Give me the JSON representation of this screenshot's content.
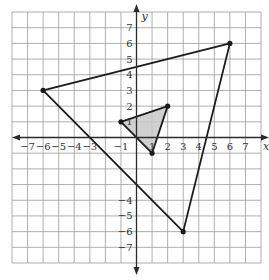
{
  "chart_data": {
    "type": "coordinate-plane",
    "title": "",
    "xlabel": "x",
    "ylabel": "y",
    "xlim": [
      -8,
      8
    ],
    "ylim": [
      -8,
      8
    ],
    "grid": true,
    "x_tick_labels": [
      {
        "value": -7,
        "label": "−7"
      },
      {
        "value": -6,
        "label": "−6"
      },
      {
        "value": -5,
        "label": "−5"
      },
      {
        "value": -4,
        "label": "−4"
      },
      {
        "value": -3,
        "label": "−3"
      },
      {
        "value": -1,
        "label": "−1"
      },
      {
        "value": 1,
        "label": "1"
      },
      {
        "value": 2,
        "label": "2"
      },
      {
        "value": 3,
        "label": "3"
      },
      {
        "value": 4,
        "label": "4"
      },
      {
        "value": 5,
        "label": "5"
      },
      {
        "value": 6,
        "label": "6"
      },
      {
        "value": 7,
        "label": "7"
      }
    ],
    "y_tick_labels": [
      {
        "value": 7,
        "label": "7"
      },
      {
        "value": 6,
        "label": "6"
      },
      {
        "value": 5,
        "label": "5"
      },
      {
        "value": 4,
        "label": "4"
      },
      {
        "value": 3,
        "label": "3"
      },
      {
        "value": 2,
        "label": "2"
      },
      {
        "value": 1,
        "label": "1"
      },
      {
        "value": -4,
        "label": "−4"
      },
      {
        "value": -5,
        "label": "−5"
      },
      {
        "value": -6,
        "label": "−6"
      },
      {
        "value": -7,
        "label": "−7"
      }
    ],
    "shapes": [
      {
        "name": "large-triangle",
        "vertices": [
          [
            -6,
            3
          ],
          [
            6,
            6
          ],
          [
            3,
            -6
          ]
        ],
        "fill": "none",
        "stroke": "#1a1a1a"
      },
      {
        "name": "small-shaded-triangle",
        "vertices": [
          [
            -1,
            1
          ],
          [
            2,
            2
          ],
          [
            1,
            -1
          ]
        ],
        "fill": "#c8c8c8",
        "stroke": "#1a1a1a"
      }
    ]
  },
  "colors": {
    "grid": "#9a9a9a",
    "axis": "#2a2a2a",
    "shape_stroke": "#1a1a1a",
    "shade": "#c8c8c8",
    "label": "#333333"
  }
}
